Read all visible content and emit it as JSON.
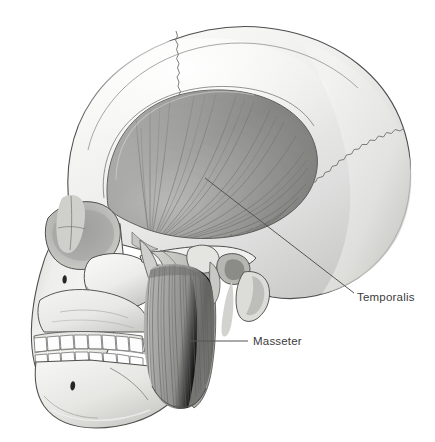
{
  "figure": {
    "view": "lateral",
    "style": "grayscale medical illustration",
    "background_color": "#ffffff"
  },
  "labels": [
    {
      "id": "temporalis",
      "text": "Temporalis",
      "text_x": 357,
      "text_y": 301,
      "leader_from_x": 205,
      "leader_from_y": 178,
      "leader_to_x": 354,
      "leader_to_y": 293,
      "leader_type": "diagonal",
      "color": "#3b3b3b"
    },
    {
      "id": "masseter",
      "text": "Masseter",
      "text_x": 253,
      "text_y": 345,
      "leader_from_x": 188,
      "leader_from_y": 341,
      "leader_to_x": 248,
      "leader_to_y": 341,
      "leader_type": "horizontal",
      "color": "#3b3b3b"
    }
  ],
  "structures": {
    "cranium": "Cranial vault (frontal, parietal, occipital bones)",
    "coronal_suture": "Coronal suture",
    "lambdoid_suture": "Lambdoid suture",
    "orbit": "Orbital cavity",
    "nasal_bone": "Nasal bone",
    "zygomatic_arch": "Zygomatic arch",
    "maxilla": "Maxilla with upper dental arch",
    "mandible": "Mandible with lower dental arch",
    "mental_foramen": "Mental foramen",
    "infraorbital_foramen": "Infraorbital foramen",
    "mastoid_process": "Mastoid process",
    "external_acoustic_meatus": "External acoustic meatus",
    "styloid_process": "Styloid process",
    "temporalis_muscle": "Temporalis muscle",
    "masseter_muscle": "Masseter muscle"
  },
  "palette": {
    "bone_light": "#f2f2f1",
    "bone_mid": "#dcdcda",
    "bone_shadow": "#b9b9b6",
    "muscle_light": "#c9c9c7",
    "muscle_mid": "#a0a09e",
    "muscle_dark": "#6f6f6d",
    "outline": "#4a4a4a",
    "fiber_line": "#6a6a68",
    "tooth_white": "#fdfdfd",
    "foramen_dark": "#2b2b2b",
    "label_text": "#3b3b3b"
  },
  "teeth": {
    "upper_count": 8,
    "lower_count": 8
  }
}
